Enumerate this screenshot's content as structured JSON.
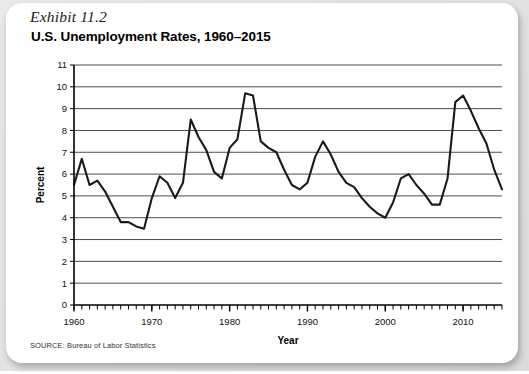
{
  "exhibit": {
    "label": "Exhibit 11.2",
    "title": "U.S. Unemployment Rates, 1960–2015",
    "source": "SOURCE: Bureau of Labor Statistics"
  },
  "colors": {
    "page_background": "#e4e4e4",
    "card_background": "#ffffff",
    "line": "#1a1a1a",
    "gridline": "#4d4d4d",
    "axis": "#000000",
    "text": "#000000"
  },
  "chart_data": {
    "type": "line",
    "title": "U.S. Unemployment Rates, 1960–2015",
    "subtitle": "Exhibit 11.2",
    "xlabel": "Year",
    "ylabel": "Percent",
    "xlim": [
      1960,
      2015
    ],
    "ylim": [
      0,
      11
    ],
    "grid": true,
    "legend": false,
    "source": "SOURCE: Bureau of Labor Statistics",
    "y_ticks": [
      0,
      1,
      2,
      3,
      4,
      5,
      6,
      7,
      8,
      9,
      10,
      11
    ],
    "x_ticks_major": [
      1960,
      1970,
      1980,
      1990,
      2000,
      2010
    ],
    "x_tick_minor_interval": 1,
    "series": [
      {
        "name": "U.S. Unemployment Rate",
        "x": [
          1960,
          1961,
          1962,
          1963,
          1964,
          1965,
          1966,
          1967,
          1968,
          1969,
          1970,
          1971,
          1972,
          1973,
          1974,
          1975,
          1976,
          1977,
          1978,
          1979,
          1980,
          1981,
          1982,
          1983,
          1984,
          1985,
          1986,
          1987,
          1988,
          1989,
          1990,
          1991,
          1992,
          1993,
          1994,
          1995,
          1996,
          1997,
          1998,
          1999,
          2000,
          2001,
          2002,
          2003,
          2004,
          2005,
          2006,
          2007,
          2008,
          2009,
          2010,
          2011,
          2012,
          2013,
          2014,
          2015
        ],
        "values": [
          5.5,
          6.7,
          5.5,
          5.7,
          5.2,
          4.5,
          3.8,
          3.8,
          3.6,
          3.5,
          4.9,
          5.9,
          5.6,
          4.9,
          5.6,
          8.5,
          7.7,
          7.1,
          6.1,
          5.8,
          7.2,
          7.6,
          9.7,
          9.6,
          7.5,
          7.2,
          7.0,
          6.2,
          5.5,
          5.3,
          5.6,
          6.8,
          7.5,
          6.9,
          6.1,
          5.6,
          5.4,
          4.9,
          4.5,
          4.2,
          4.0,
          4.7,
          5.8,
          6.0,
          5.5,
          5.1,
          4.6,
          4.6,
          5.8,
          9.3,
          9.6,
          8.9,
          8.1,
          7.4,
          6.2,
          5.3
        ]
      }
    ]
  },
  "plot_geometry": {
    "left": 68,
    "top": 62,
    "right": 496,
    "bottom": 302
  }
}
